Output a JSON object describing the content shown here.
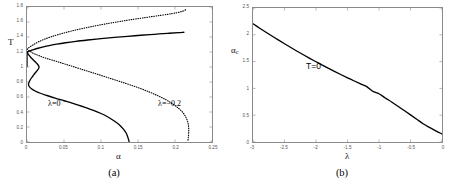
{
  "figure": {
    "panels": [
      {
        "id": "a",
        "caption": "(a)",
        "xlabel": "α",
        "ylabel": "T",
        "xticks": [
          "0",
          "0.05",
          "0.1",
          "0.15",
          "0.2",
          "0.25"
        ],
        "yticks": [
          "0",
          "0.2",
          "0.4",
          "0.6",
          "0.8",
          "1",
          "1.2",
          "1.4",
          "1.6",
          "1.8"
        ],
        "annotations": [
          {
            "text": "λ=0",
            "x": 0.048,
            "y": 0.52
          },
          {
            "text": "λ=−0.2",
            "x": 0.178,
            "y": 0.52
          }
        ]
      },
      {
        "id": "b",
        "caption": "(b)",
        "xlabel": "λ",
        "ylabel": "α",
        "ylabel_sub": "c",
        "xticks": [
          "-3",
          "-2.5",
          "-2",
          "-1.5",
          "-1",
          "-0.5",
          "0"
        ],
        "yticks": [
          "0",
          "0.5",
          "1",
          "1.5",
          "2",
          "2.5"
        ],
        "annotations": [
          {
            "text": "T=0",
            "x": -1.72,
            "y": 1.33
          }
        ]
      }
    ]
  },
  "chart_data": [
    {
      "type": "line",
      "panel": "a",
      "title": "",
      "xlabel": "α",
      "ylabel": "T",
      "xlim": [
        0,
        0.25
      ],
      "ylim": [
        0,
        1.8
      ],
      "grid": false,
      "legend": "inline-annotations",
      "xticks": [
        0,
        0.05,
        0.1,
        0.15,
        0.2,
        0.25
      ],
      "yticks": [
        0,
        0.2,
        0.4,
        0.6,
        0.8,
        1.0,
        1.2,
        1.4,
        1.6,
        1.8
      ],
      "series": [
        {
          "name": "λ=0 upper branch",
          "style": "solid",
          "color": "#000000",
          "points": [
            [
              0.0,
              1.2
            ],
            [
              0.004,
              1.215
            ],
            [
              0.009,
              1.232
            ],
            [
              0.015,
              1.25
            ],
            [
              0.022,
              1.268
            ],
            [
              0.03,
              1.286
            ],
            [
              0.04,
              1.304
            ],
            [
              0.052,
              1.323
            ],
            [
              0.066,
              1.342
            ],
            [
              0.082,
              1.36
            ],
            [
              0.1,
              1.378
            ],
            [
              0.118,
              1.394
            ],
            [
              0.136,
              1.409
            ],
            [
              0.154,
              1.423
            ],
            [
              0.172,
              1.436
            ],
            [
              0.19,
              1.449
            ],
            [
              0.205,
              1.458
            ],
            [
              0.212,
              1.463
            ]
          ]
        },
        {
          "name": "λ=0 lower branch",
          "style": "solid",
          "color": "#000000",
          "points": [
            [
              0.0,
              1.2
            ],
            [
              0.002,
              1.165
            ],
            [
              0.005,
              1.13
            ],
            [
              0.008,
              1.1
            ],
            [
              0.011,
              1.07
            ],
            [
              0.014,
              1.04
            ],
            [
              0.016,
              1.01
            ],
            [
              0.016,
              0.985
            ],
            [
              0.014,
              0.955
            ],
            [
              0.011,
              0.92
            ],
            [
              0.008,
              0.88
            ],
            [
              0.005,
              0.84
            ],
            [
              0.003,
              0.8
            ],
            [
              0.002,
              0.77
            ],
            [
              0.003,
              0.74
            ],
            [
              0.006,
              0.71
            ],
            [
              0.011,
              0.68
            ],
            [
              0.018,
              0.65
            ],
            [
              0.027,
              0.62
            ],
            [
              0.038,
              0.585
            ],
            [
              0.05,
              0.55
            ],
            [
              0.063,
              0.512
            ],
            [
              0.076,
              0.47
            ],
            [
              0.089,
              0.425
            ],
            [
              0.1,
              0.38
            ],
            [
              0.11,
              0.33
            ],
            [
              0.118,
              0.28
            ],
            [
              0.125,
              0.228
            ],
            [
              0.13,
              0.175
            ],
            [
              0.134,
              0.12
            ],
            [
              0.136,
              0.07
            ],
            [
              0.1375,
              0.025
            ],
            [
              0.138,
              0.0
            ]
          ]
        },
        {
          "name": "λ=0 spine",
          "style": "solid",
          "color": "#000000",
          "points": [
            [
              0.0,
              1.2
            ],
            [
              0.0,
              1.12
            ],
            [
              0.0,
              1.06
            ],
            [
              0.0,
              1.01
            ]
          ]
        },
        {
          "name": "λ=−0.2 upper branch",
          "style": "dotted",
          "color": "#000000",
          "points": [
            [
              0.0,
              1.238
            ],
            [
              0.004,
              1.268
            ],
            [
              0.009,
              1.3
            ],
            [
              0.015,
              1.333
            ],
            [
              0.023,
              1.368
            ],
            [
              0.033,
              1.404
            ],
            [
              0.045,
              1.44
            ],
            [
              0.059,
              1.477
            ],
            [
              0.075,
              1.513
            ],
            [
              0.092,
              1.548
            ],
            [
              0.11,
              1.581
            ],
            [
              0.128,
              1.611
            ],
            [
              0.146,
              1.639
            ],
            [
              0.164,
              1.665
            ],
            [
              0.181,
              1.689
            ],
            [
              0.196,
              1.712
            ],
            [
              0.207,
              1.734
            ],
            [
              0.213,
              1.755
            ],
            [
              0.215,
              1.77
            ]
          ]
        },
        {
          "name": "λ=−0.2 lower branch",
          "style": "dotted",
          "color": "#000000",
          "points": [
            [
              0.0,
              1.238
            ],
            [
              0.003,
              1.215
            ],
            [
              0.007,
              1.192
            ],
            [
              0.011,
              1.172
            ],
            [
              0.016,
              1.152
            ],
            [
              0.021,
              1.133
            ],
            [
              0.027,
              1.113
            ],
            [
              0.034,
              1.092
            ],
            [
              0.042,
              1.068
            ],
            [
              0.051,
              1.04
            ],
            [
              0.061,
              1.01
            ],
            [
              0.072,
              0.975
            ],
            [
              0.084,
              0.938
            ],
            [
              0.097,
              0.898
            ],
            [
              0.11,
              0.856
            ],
            [
              0.124,
              0.812
            ],
            [
              0.138,
              0.766
            ],
            [
              0.152,
              0.718
            ],
            [
              0.165,
              0.668
            ],
            [
              0.177,
              0.616
            ],
            [
              0.188,
              0.562
            ],
            [
              0.197,
              0.506
            ],
            [
              0.205,
              0.448
            ],
            [
              0.211,
              0.388
            ],
            [
              0.215,
              0.325
            ],
            [
              0.2175,
              0.258
            ],
            [
              0.2185,
              0.19
            ],
            [
              0.2185,
              0.122
            ],
            [
              0.218,
              0.06
            ],
            [
              0.2175,
              0.02
            ]
          ]
        }
      ],
      "annotations": [
        {
          "text": "λ=0",
          "x": 0.048,
          "y": 0.52
        },
        {
          "text": "λ=−0.2",
          "x": 0.178,
          "y": 0.52
        }
      ]
    },
    {
      "type": "line",
      "panel": "b",
      "title": "",
      "xlabel": "λ",
      "ylabel": "α_c",
      "xlim": [
        -3,
        0
      ],
      "ylim": [
        0,
        2.5
      ],
      "grid": false,
      "xticks": [
        -3,
        -2.5,
        -2,
        -1.5,
        -1,
        -0.5,
        0
      ],
      "yticks": [
        0,
        0.5,
        1.0,
        1.5,
        2.0,
        2.5
      ],
      "series": [
        {
          "name": "T=0 critical line",
          "style": "solid",
          "color": "#000000",
          "points": [
            [
              -3.0,
              2.205
            ],
            [
              -2.9,
              2.128
            ],
            [
              -2.8,
              2.052
            ],
            [
              -2.7,
              1.978
            ],
            [
              -2.6,
              1.905
            ],
            [
              -2.5,
              1.833
            ],
            [
              -2.4,
              1.763
            ],
            [
              -2.3,
              1.694
            ],
            [
              -2.2,
              1.627
            ],
            [
              -2.1,
              1.561
            ],
            [
              -2.0,
              1.497
            ],
            [
              -1.9,
              1.434
            ],
            [
              -1.8,
              1.373
            ],
            [
              -1.7,
              1.313
            ],
            [
              -1.6,
              1.255
            ],
            [
              -1.5,
              1.198
            ],
            [
              -1.4,
              1.143
            ],
            [
              -1.3,
              1.089
            ],
            [
              -1.2,
              1.037
            ],
            [
              -1.1,
              0.946
            ],
            [
              -1.0,
              0.9
            ],
            [
              -0.9,
              0.822
            ],
            [
              -0.8,
              0.747
            ],
            [
              -0.7,
              0.668
            ],
            [
              -0.6,
              0.587
            ],
            [
              -0.5,
              0.506
            ],
            [
              -0.4,
              0.424
            ],
            [
              -0.3,
              0.341
            ],
            [
              -0.2,
              0.272
            ],
            [
              -0.1,
              0.207
            ],
            [
              -0.05,
              0.178
            ],
            [
              0.0,
              0.15
            ]
          ]
        }
      ],
      "annotations": [
        {
          "text": "T=0",
          "x": -1.72,
          "y": 1.33
        }
      ]
    }
  ]
}
